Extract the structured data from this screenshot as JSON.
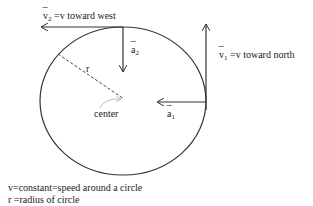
{
  "labels": {
    "v2": {
      "symbol": "v",
      "sub": "2",
      "text": " =v toward west"
    },
    "v1": {
      "symbol": "v",
      "sub": "1",
      "text": " =v toward north"
    },
    "a2": {
      "symbol": "a",
      "sub": "2"
    },
    "a1": {
      "symbol": "a",
      "sub": "1"
    },
    "r": "r",
    "center": "center"
  },
  "notes": {
    "line1": "v=constant=speed around a circle",
    "line2": "r =radius of circle"
  },
  "colors": {
    "stroke": "#333333",
    "dashed": "#444444",
    "faint": "#aaaaaa"
  }
}
